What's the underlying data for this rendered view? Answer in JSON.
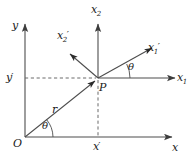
{
  "figure": {
    "background_color": "#ffffff",
    "line_color": "#4d4d4d",
    "text_color": "#1a1a1a",
    "width": 190,
    "height": 164
  },
  "labels": {
    "y_axis": "y",
    "x_axis": "x",
    "x2_axis": "x",
    "x2_axis_sub": "2",
    "x1_axis": "x",
    "x1_axis_sub": "1",
    "x1_prime": "x",
    "x1_prime_sub": "1",
    "x1_prime_mark": "′",
    "x2_prime": "x",
    "x2_prime_sub": "2",
    "x2_prime_mark": "′",
    "origin": "O",
    "point": "P",
    "radius": "r",
    "theta_origin": "θ",
    "theta_point": "θ",
    "x_prime": "x",
    "x_prime_mark": "′",
    "y_prime": "y",
    "y_prime_mark": "′"
  },
  "geometry": {
    "origin_px": [
      25,
      137
    ],
    "point_P_px": [
      98,
      78
    ],
    "y_axis_top_px": [
      25,
      22
    ],
    "x_axis_right_px": [
      175,
      137
    ],
    "x2_axis_top_px": [
      98,
      20
    ],
    "x1_axis_right_px": [
      178,
      78
    ],
    "x1_prime_tip_px": [
      155,
      45
    ],
    "x2_prime_tip_px": [
      66,
      50
    ],
    "r_arrow_tip_px": [
      92,
      83
    ],
    "theta_origin_deg": 39,
    "theta_point_deg": 26,
    "dashed_horizontal_from_px": [
      25,
      78
    ],
    "dashed_vertical_to_px": [
      98,
      137
    ]
  }
}
